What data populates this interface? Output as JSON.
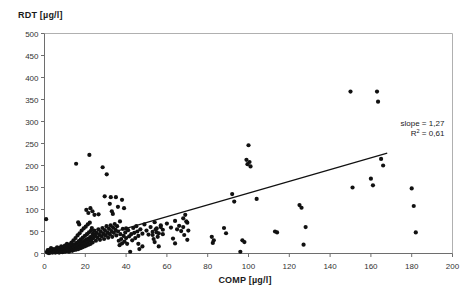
{
  "chart_data": {
    "type": "scatter",
    "title": "",
    "xlabel": "COMP [µg/l]",
    "ylabel": "RDT [µg/l]",
    "xlim": [
      0,
      200
    ],
    "ylim": [
      0,
      500
    ],
    "xticks": [
      0,
      20,
      40,
      60,
      80,
      100,
      120,
      140,
      160,
      180,
      200
    ],
    "yticks": [
      0,
      50,
      100,
      150,
      200,
      250,
      300,
      350,
      400,
      450,
      500
    ],
    "xticklabels": [
      "0",
      "20",
      "40",
      "60",
      "80",
      "100",
      "120",
      "140",
      "160",
      "180",
      "200"
    ],
    "yticklabels": [
      "0",
      "50",
      "100",
      "150",
      "200",
      "250",
      "300",
      "350",
      "400",
      "450",
      "500"
    ],
    "grid": false,
    "legend": null,
    "marker": "filled-circle",
    "marker_color": "#111111",
    "marker_size": 2.1,
    "annotations": [
      {
        "text": "slope = 1,27",
        "x": 196,
        "y": 290
      },
      {
        "text": "R² = 0,61",
        "x": 196,
        "y": 268
      }
    ],
    "trendline": {
      "type": "linear",
      "slope": 1.27,
      "r_squared": 0.61,
      "x_start": 1.0,
      "x_end": 168.0,
      "y_start": 5.0,
      "y_end": 228.0,
      "color": "#111111",
      "width": 1.2
    },
    "series": [
      {
        "name": "RDT vs COMP",
        "points": [
          [
            0.8,
            78
          ],
          [
            1.2,
            4
          ],
          [
            1.4,
            2
          ],
          [
            1.6,
            8
          ],
          [
            1.8,
            3
          ],
          [
            2.0,
            6
          ],
          [
            2.2,
            1
          ],
          [
            2.4,
            5
          ],
          [
            2.6,
            9
          ],
          [
            2.8,
            2
          ],
          [
            3.0,
            4
          ],
          [
            3.2,
            12
          ],
          [
            3.4,
            3
          ],
          [
            3.6,
            7
          ],
          [
            3.8,
            5
          ],
          [
            4.0,
            2
          ],
          [
            4.2,
            10
          ],
          [
            4.4,
            4
          ],
          [
            4.6,
            6
          ],
          [
            4.8,
            3
          ],
          [
            5.0,
            8
          ],
          [
            5.2,
            5
          ],
          [
            5.4,
            2
          ],
          [
            5.6,
            11
          ],
          [
            5.8,
            6
          ],
          [
            6.0,
            4
          ],
          [
            6.2,
            14
          ],
          [
            6.4,
            7
          ],
          [
            6.6,
            3
          ],
          [
            6.8,
            9
          ],
          [
            7.0,
            5
          ],
          [
            7.2,
            2
          ],
          [
            7.4,
            12
          ],
          [
            7.6,
            6
          ],
          [
            7.8,
            8
          ],
          [
            8.0,
            4
          ],
          [
            8.2,
            16
          ],
          [
            8.4,
            9
          ],
          [
            8.6,
            5
          ],
          [
            8.8,
            3
          ],
          [
            9.0,
            11
          ],
          [
            9.2,
            7
          ],
          [
            9.4,
            14
          ],
          [
            9.6,
            6
          ],
          [
            9.8,
            4
          ],
          [
            10.0,
            18
          ],
          [
            10.2,
            9
          ],
          [
            10.4,
            5
          ],
          [
            10.6,
            12
          ],
          [
            10.8,
            7
          ],
          [
            11.0,
            22
          ],
          [
            11.2,
            10
          ],
          [
            11.4,
            6
          ],
          [
            11.6,
            15
          ],
          [
            11.8,
            8
          ],
          [
            12.0,
            4
          ],
          [
            12.2,
            20
          ],
          [
            12.4,
            11
          ],
          [
            12.6,
            7
          ],
          [
            12.8,
            16
          ],
          [
            13.0,
            9
          ],
          [
            13.2,
            25
          ],
          [
            13.4,
            12
          ],
          [
            13.6,
            6
          ],
          [
            13.8,
            18
          ],
          [
            14.0,
            10
          ],
          [
            14.2,
            30
          ],
          [
            14.4,
            14
          ],
          [
            14.6,
            8
          ],
          [
            14.8,
            21
          ],
          [
            15.0,
            11
          ],
          [
            15.2,
            35
          ],
          [
            15.4,
            16
          ],
          [
            15.6,
            9
          ],
          [
            15.8,
            24
          ],
          [
            16.0,
            13
          ],
          [
            16.2,
            41
          ],
          [
            16.4,
            19
          ],
          [
            16.6,
            10
          ],
          [
            16.8,
            28
          ],
          [
            17.0,
            15
          ],
          [
            17.2,
            46
          ],
          [
            17.4,
            22
          ],
          [
            17.6,
            12
          ],
          [
            17.8,
            32
          ],
          [
            18.0,
            17
          ],
          [
            18.2,
            52
          ],
          [
            18.4,
            25
          ],
          [
            18.6,
            14
          ],
          [
            18.8,
            36
          ],
          [
            19.0,
            20
          ],
          [
            19.2,
            57
          ],
          [
            19.4,
            28
          ],
          [
            19.6,
            16
          ],
          [
            19.8,
            40
          ],
          [
            20.0,
            23
          ],
          [
            20.2,
            61
          ],
          [
            20.4,
            31
          ],
          [
            20.6,
            18
          ],
          [
            20.8,
            44
          ],
          [
            21.0,
            26
          ],
          [
            21.2,
            66
          ],
          [
            21.4,
            34
          ],
          [
            21.6,
            20
          ],
          [
            21.8,
            48
          ],
          [
            22.0,
            29
          ],
          [
            22.2,
            70
          ],
          [
            22.4,
            37
          ],
          [
            22.6,
            22
          ],
          [
            22.8,
            52
          ],
          [
            23.0,
            32
          ],
          [
            23.2,
            58
          ],
          [
            23.4,
            40
          ],
          [
            23.6,
            25
          ],
          [
            23.8,
            46
          ],
          [
            24.0,
            35
          ],
          [
            24.4,
            52
          ],
          [
            24.8,
            41
          ],
          [
            25.2,
            29
          ],
          [
            25.6,
            47
          ],
          [
            26.0,
            36
          ],
          [
            26.4,
            55
          ],
          [
            26.8,
            43
          ],
          [
            27.2,
            31
          ],
          [
            27.6,
            50
          ],
          [
            28.0,
            39
          ],
          [
            28.4,
            58
          ],
          [
            28.8,
            45
          ],
          [
            29.2,
            33
          ],
          [
            29.6,
            53
          ],
          [
            30.0,
            41
          ],
          [
            30.4,
            62
          ],
          [
            30.8,
            48
          ],
          [
            31.2,
            36
          ],
          [
            31.6,
            56
          ],
          [
            32.0,
            44
          ],
          [
            32.4,
            64
          ],
          [
            32.8,
            51
          ],
          [
            33.2,
            38
          ],
          [
            33.6,
            59
          ],
          [
            34.0,
            47
          ],
          [
            34.4,
            67
          ],
          [
            34.8,
            54
          ],
          [
            35.2,
            41
          ],
          [
            35.6,
            62
          ],
          [
            36.0,
            50
          ],
          [
            36.4,
            29
          ],
          [
            36.8,
            19
          ],
          [
            37.2,
            44
          ],
          [
            37.6,
            33
          ],
          [
            38.0,
            23
          ],
          [
            38.4,
            56
          ],
          [
            38.8,
            40
          ],
          [
            39.2,
            27
          ],
          [
            39.6,
            48
          ],
          [
            40.0,
            35
          ],
          [
            40.5,
            22
          ],
          [
            41.0,
            53
          ],
          [
            41.5,
            39
          ],
          [
            42.0,
            4
          ],
          [
            42.5,
            44
          ],
          [
            43.0,
            30
          ],
          [
            43.5,
            58
          ],
          [
            44.0,
            47
          ],
          [
            44.5,
            35
          ],
          [
            45.0,
            62
          ],
          [
            45.5,
            50
          ],
          [
            46.0,
            40
          ],
          [
            47.0,
            55
          ],
          [
            48.0,
            45
          ],
          [
            49.0,
            66
          ],
          [
            50.0,
            52
          ],
          [
            51.0,
            43
          ],
          [
            52.0,
            60
          ],
          [
            53.0,
            49
          ],
          [
            54.0,
            71
          ],
          [
            55.0,
            57
          ],
          [
            56.0,
            46
          ],
          [
            57.0,
            64
          ],
          [
            58.0,
            54
          ],
          [
            60.0,
            68
          ],
          [
            62.0,
            59
          ],
          [
            64.0,
            74
          ],
          [
            66.0,
            63
          ],
          [
            68.0,
            80
          ],
          [
            70.0,
            70
          ],
          [
            15.5,
            204
          ],
          [
            22.0,
            224
          ],
          [
            16.5,
            71
          ],
          [
            17.0,
            66
          ],
          [
            20.5,
            99
          ],
          [
            21.5,
            92
          ],
          [
            22.5,
            103
          ],
          [
            23.5,
            96
          ],
          [
            24.5,
            88
          ],
          [
            26.5,
            89
          ],
          [
            28.5,
            196
          ],
          [
            30.5,
            180
          ],
          [
            29.5,
            130
          ],
          [
            32.0,
            113
          ],
          [
            32.5,
            128
          ],
          [
            33.0,
            96
          ],
          [
            33.5,
            90
          ],
          [
            35.0,
            128
          ],
          [
            36.0,
            106
          ],
          [
            37.0,
            73
          ],
          [
            38.0,
            122
          ],
          [
            39.0,
            103
          ],
          [
            40.0,
            57
          ],
          [
            46.0,
            22
          ],
          [
            46.5,
            10
          ],
          [
            48.0,
            16
          ],
          [
            53.0,
            42
          ],
          [
            53.5,
            33
          ],
          [
            54.0,
            26
          ],
          [
            54.5,
            55
          ],
          [
            55.0,
            48
          ],
          [
            55.5,
            38
          ],
          [
            56.0,
            16
          ],
          [
            57.0,
            60
          ],
          [
            58.0,
            44
          ],
          [
            63.0,
            34
          ],
          [
            64.0,
            23
          ],
          [
            65.0,
            55
          ],
          [
            67.0,
            51
          ],
          [
            68.0,
            60
          ],
          [
            68.5,
            42
          ],
          [
            69.0,
            88
          ],
          [
            69.5,
            73
          ],
          [
            70.0,
            31
          ],
          [
            70.5,
            52
          ],
          [
            82.0,
            38
          ],
          [
            82.5,
            24
          ],
          [
            83.0,
            30
          ],
          [
            88.0,
            58
          ],
          [
            89.0,
            46
          ],
          [
            92.0,
            135
          ],
          [
            93.0,
            118
          ],
          [
            96.0,
            4
          ],
          [
            97.0,
            30
          ],
          [
            98.0,
            26
          ],
          [
            99.0,
            213
          ],
          [
            99.5,
            203
          ],
          [
            100.0,
            246
          ],
          [
            100.5,
            208
          ],
          [
            101.0,
            198
          ],
          [
            104.0,
            124
          ],
          [
            113.0,
            50
          ],
          [
            114.0,
            48
          ],
          [
            125.0,
            110
          ],
          [
            126.0,
            104
          ],
          [
            127.0,
            20
          ],
          [
            128.0,
            60
          ],
          [
            150.0,
            368
          ],
          [
            151.0,
            150
          ],
          [
            160.0,
            170
          ],
          [
            161.0,
            155
          ],
          [
            163.0,
            368
          ],
          [
            163.5,
            345
          ],
          [
            165.0,
            215
          ],
          [
            166.0,
            200
          ],
          [
            180.0,
            148
          ],
          [
            181.0,
            108
          ],
          [
            182.0,
            48
          ]
        ]
      }
    ]
  },
  "figure": {
    "frame_color": "#b0b0b0",
    "axis_color": "#6e6e6e",
    "background": "#ffffff"
  }
}
